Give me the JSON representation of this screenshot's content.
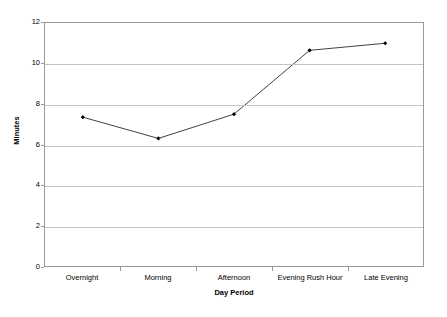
{
  "chart_data": {
    "type": "line",
    "title": "",
    "xlabel": "Day Period",
    "ylabel": "Minutes",
    "categories": [
      "Overnight",
      "Morning",
      "Afternoon",
      "Evening Rush Hour",
      "Late Evening"
    ],
    "series": [
      {
        "name": "Minutes",
        "values": [
          7.35,
          6.3,
          7.5,
          10.65,
          11.0
        ]
      }
    ],
    "ylim": [
      0,
      12
    ],
    "yticks": [
      0,
      2,
      4,
      6,
      8,
      10,
      12
    ],
    "ytick_labels": [
      "0",
      "2",
      "4",
      "6",
      "8",
      "10",
      "12"
    ],
    "grid": "horizontal",
    "legend": "none",
    "marker": "filled-diamond",
    "line_color": "#3f3f3f",
    "grid_color": "#c3c3c3",
    "frame_color": "#9a9a9a",
    "background": "#ffffff"
  }
}
